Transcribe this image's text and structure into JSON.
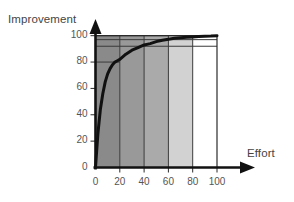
{
  "chart_data": {
    "type": "area",
    "title": "",
    "subtitle": "",
    "xlabel": "Effort",
    "ylabel": "Improvement",
    "xlim": [
      0,
      110
    ],
    "ylim": [
      0,
      108
    ],
    "grid": false,
    "legend_position": "none",
    "x_ticks": [
      {
        "value": 0,
        "label": "0"
      },
      {
        "value": 20,
        "label": "20"
      },
      {
        "value": 40,
        "label": "40"
      },
      {
        "value": 60,
        "label": "60"
      },
      {
        "value": 80,
        "label": "80"
      },
      {
        "value": 100,
        "label": "100"
      }
    ],
    "y_ticks": [
      {
        "value": 0,
        "label": "0"
      },
      {
        "value": 20,
        "label": "20"
      },
      {
        "value": 40,
        "label": "40"
      },
      {
        "value": 60,
        "label": "60"
      },
      {
        "value": 80,
        "label": "80"
      },
      {
        "value": 100,
        "label": "100"
      }
    ],
    "bands": [
      {
        "name": "band-0-20",
        "x_from": 0,
        "x_to": 20,
        "color": "#8a8a8a"
      },
      {
        "name": "band-20-40",
        "x_from": 20,
        "x_to": 40,
        "color": "#999999"
      },
      {
        "name": "band-40-60",
        "x_from": 40,
        "x_to": 60,
        "color": "#aaaaaa"
      },
      {
        "name": "band-60-80",
        "x_from": 60,
        "x_to": 80,
        "color": "#d2d2d2"
      },
      {
        "name": "band-80-100",
        "x_from": 80,
        "x_to": 100,
        "color": "#ffffff"
      }
    ],
    "horizontal_rules": [
      {
        "name": "rule-100",
        "y": 100
      },
      {
        "name": "rule-97",
        "y": 97
      },
      {
        "name": "rule-92",
        "y": 92
      },
      {
        "name": "rule-80",
        "y": 80
      }
    ],
    "series": [
      {
        "name": "Improvement curve",
        "type": "line",
        "color": "#111111",
        "line_width": 3,
        "asymptote": 100,
        "x": [
          0,
          2,
          4,
          6,
          8,
          10,
          12,
          14,
          16,
          18,
          20,
          25,
          30,
          35,
          40,
          45,
          50,
          55,
          60,
          65,
          70,
          75,
          80,
          85,
          90,
          95,
          100
        ],
        "y": [
          0,
          26,
          44,
          56,
          65,
          71,
          75,
          78,
          80,
          81,
          82,
          86,
          89,
          91,
          93,
          94,
          95.5,
          96.5,
          97.3,
          98,
          98.4,
          98.8,
          99.1,
          99.3,
          99.5,
          99.7,
          100
        ]
      }
    ]
  },
  "axes": {
    "y_title": "Improvement",
    "x_title": "Effort"
  }
}
